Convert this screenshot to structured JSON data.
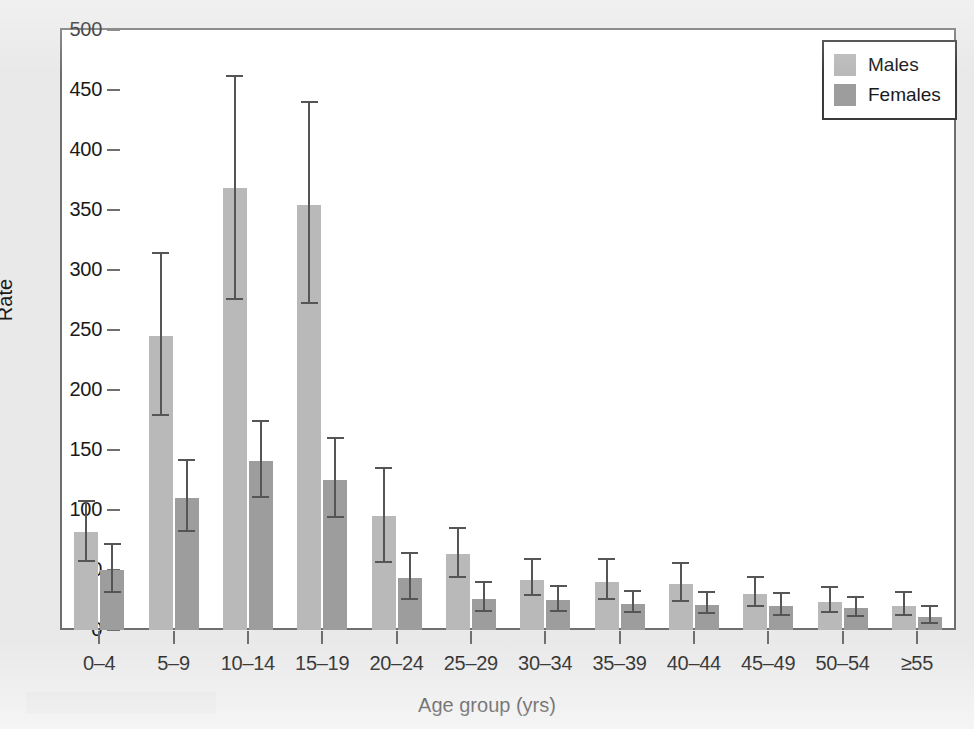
{
  "figure": {
    "background_color": "#e9e9e9",
    "plot_background_color": "#ffffff",
    "frame_color": "#6f6f6f"
  },
  "legend": {
    "position": "top-right",
    "entries": [
      {
        "label": "Males",
        "color": "#b9b9b9"
      },
      {
        "label": "Females",
        "color": "#9d9d9d"
      }
    ]
  },
  "chart_data": {
    "type": "bar",
    "title": "",
    "subtitle": "",
    "xlabel": "Age group (yrs)",
    "ylabel": "Rate",
    "ylim": [
      0,
      500
    ],
    "yticks": [
      0,
      50,
      100,
      150,
      200,
      250,
      300,
      350,
      400,
      450,
      500
    ],
    "ytick_labels": [
      "0",
      "50",
      "100",
      "150",
      "200",
      "250",
      "300",
      "350",
      "400",
      "450",
      "500"
    ],
    "grid": false,
    "legend_position": "top-right",
    "error_bars": "95% confidence interval",
    "categories": [
      "0–4",
      "5–9",
      "10–14",
      "15–19",
      "20–24",
      "25–29",
      "30–34",
      "35–39",
      "40–44",
      "45–49",
      "50–54",
      "≥55"
    ],
    "series": [
      {
        "name": "Males",
        "color": "#b9b9b9",
        "values": [
          82,
          245,
          368,
          354,
          95,
          63,
          42,
          40,
          38,
          30,
          23,
          20
        ],
        "err_low": [
          57,
          178,
          275,
          272,
          56,
          43,
          28,
          25,
          23,
          19,
          14,
          12
        ],
        "err_high": [
          107,
          313,
          461,
          439,
          134,
          84,
          58,
          58,
          55,
          43,
          35,
          31
        ]
      },
      {
        "name": "Females",
        "color": "#9d9d9d",
        "values": [
          50,
          110,
          141,
          125,
          43,
          26,
          25,
          22,
          21,
          20,
          18,
          11
        ],
        "err_low": [
          31,
          82,
          110,
          93,
          25,
          15,
          15,
          14,
          13,
          12,
          11,
          5
        ],
        "err_high": [
          71,
          141,
          173,
          159,
          63,
          39,
          36,
          32,
          31,
          30,
          27,
          19
        ]
      }
    ]
  }
}
